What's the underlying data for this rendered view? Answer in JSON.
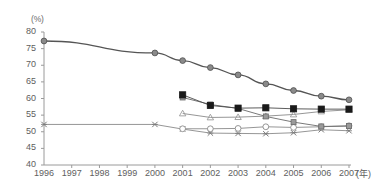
{
  "chart_data": {
    "type": "line",
    "title": "",
    "subtitle": "",
    "xlabel": "(年)",
    "ylabel": "(%)",
    "ylim": [
      40,
      80
    ],
    "ytick_labels": [
      "80",
      "75",
      "70",
      "65",
      "60",
      "55",
      "50",
      "45",
      "40"
    ],
    "ytick_values": [
      80,
      75,
      70,
      65,
      60,
      55,
      50,
      45,
      40
    ],
    "xtick_labels": [
      "1996",
      "1997",
      "1998",
      "1999",
      "2000",
      "2001",
      "2002",
      "2003",
      "2004",
      "2005",
      "2006",
      "2007"
    ],
    "x": [
      1996,
      1997,
      1998,
      1999,
      2000,
      2001,
      2002,
      2003,
      2004,
      2005,
      2006,
      2007
    ],
    "grid": false,
    "legend": "none",
    "series": [
      {
        "name": "series-1",
        "marker": "gray-circle",
        "color": "#8a8a8a",
        "line_color": "#555555",
        "x": [
          1996,
          2000,
          2001,
          2002,
          2003,
          2004,
          2005,
          2006,
          2007
        ],
        "values": [
          77.3,
          73.7,
          71.4,
          69.3,
          67.1,
          64.4,
          62.4,
          60.7,
          59.6
        ]
      },
      {
        "name": "series-2",
        "marker": "black-square",
        "color": "#1a1a1a",
        "line_color": "#4a4a4a",
        "x": [
          2001,
          2002,
          2003,
          2004,
          2005,
          2006,
          2007
        ],
        "values": [
          61.1,
          57.9,
          57.1,
          57.2,
          56.9,
          56.8,
          56.8
        ]
      },
      {
        "name": "series-3",
        "marker": "gray-square",
        "color": "#9a9a9a",
        "line_color": "#6a6a6a",
        "x": [
          2001,
          2002,
          2003,
          2004,
          2005,
          2006,
          2007
        ],
        "values": [
          60.3,
          58.2,
          57.0,
          54.6,
          52.9,
          51.6,
          51.7
        ]
      },
      {
        "name": "series-4",
        "marker": "gray-triangle",
        "color": "#9a9a9a",
        "line_color": "#8a8a8a",
        "x": [
          2001,
          2002,
          2003,
          2004,
          2005,
          2006,
          2007
        ],
        "values": [
          55.5,
          54.3,
          54.4,
          54.7,
          55.2,
          56.1,
          56.6
        ]
      },
      {
        "name": "series-5",
        "marker": "open-circle",
        "color": "#8a8a8a",
        "line_color": "#8a8a8a",
        "x": [
          2001,
          2002,
          2003,
          2004,
          2005,
          2006,
          2007
        ],
        "values": [
          50.9,
          50.9,
          51.0,
          51.5,
          51.3,
          51.5,
          51.8
        ]
      },
      {
        "name": "series-6",
        "marker": "x-cross",
        "color": "#7a7a7a",
        "line_color": "#8a8a8a",
        "x": [
          1996,
          2000,
          2001,
          2002,
          2003,
          2004,
          2005,
          2006,
          2007
        ],
        "values": [
          52.2,
          52.2,
          50.8,
          49.6,
          49.5,
          49.4,
          49.7,
          50.6,
          50.3
        ]
      }
    ]
  },
  "axes": {
    "y_unit_label": "(%)",
    "x_unit_label": "(年)"
  },
  "colors": {
    "axis": "#9a9a9a",
    "text": "#5e5e5e",
    "background": "#ffffff"
  }
}
